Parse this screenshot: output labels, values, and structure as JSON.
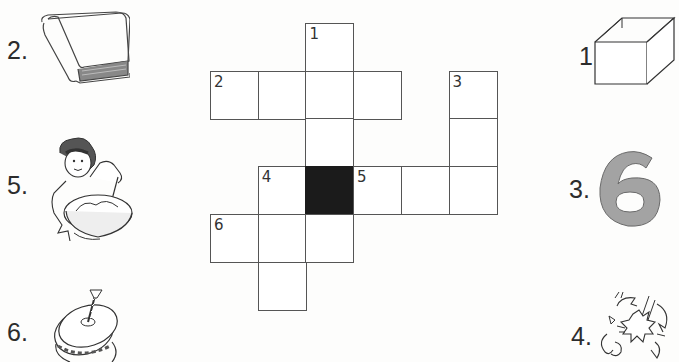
{
  "puzzle": {
    "type": "picture crossword",
    "grid": {
      "cols": 6,
      "rows": 6,
      "cells": [
        {
          "col": 2,
          "row": 0,
          "number": "1",
          "black": false
        },
        {
          "col": 0,
          "row": 1,
          "number": "2",
          "black": false
        },
        {
          "col": 1,
          "row": 1,
          "number": "",
          "black": false
        },
        {
          "col": 2,
          "row": 1,
          "number": "",
          "black": false
        },
        {
          "col": 3,
          "row": 1,
          "number": "",
          "black": false
        },
        {
          "col": 5,
          "row": 1,
          "number": "3",
          "black": false
        },
        {
          "col": 2,
          "row": 2,
          "number": "",
          "black": false
        },
        {
          "col": 5,
          "row": 2,
          "number": "",
          "black": false
        },
        {
          "col": 1,
          "row": 3,
          "number": "4",
          "black": false
        },
        {
          "col": 2,
          "row": 3,
          "number": "",
          "black": true
        },
        {
          "col": 3,
          "row": 3,
          "number": "5",
          "black": false
        },
        {
          "col": 4,
          "row": 3,
          "number": "",
          "black": false
        },
        {
          "col": 5,
          "row": 3,
          "number": "",
          "black": false
        },
        {
          "col": 0,
          "row": 4,
          "number": "6",
          "black": false
        },
        {
          "col": 1,
          "row": 4,
          "number": "",
          "black": false
        },
        {
          "col": 2,
          "row": 4,
          "number": "",
          "black": false
        },
        {
          "col": 1,
          "row": 5,
          "number": "",
          "black": false
        }
      ]
    },
    "clues": [
      {
        "label": "1.",
        "picture": "open-box",
        "side": "right"
      },
      {
        "label": "2.",
        "picture": "book",
        "side": "left"
      },
      {
        "label": "3.",
        "picture": "number-six",
        "side": "right",
        "glyph": "6"
      },
      {
        "label": "4.",
        "picture": "breaking-egg",
        "side": "right"
      },
      {
        "label": "5.",
        "picture": "child-mixing-bowl",
        "side": "left"
      },
      {
        "label": "6.",
        "picture": "spinning-top",
        "side": "left"
      }
    ]
  },
  "colors": {
    "black_cell": "#1b1b1b",
    "six_fill": "#a3a3a3",
    "line": "#555555"
  }
}
